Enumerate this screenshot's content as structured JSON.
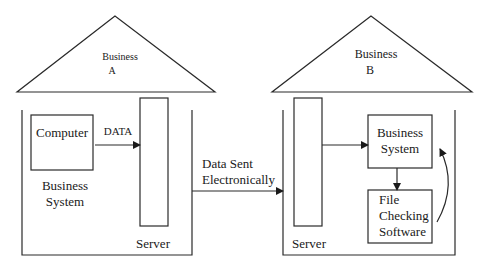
{
  "diagram": {
    "business_a": {
      "roof_label_line1": "Business",
      "roof_label_line2": "A",
      "computer_label": "Computer",
      "data_arrow_label": "DATA",
      "system_label_line1": "Business",
      "system_label_line2": "System",
      "server_label": "Server"
    },
    "connection": {
      "label_line1": "Data Sent",
      "label_line2": "Electronically"
    },
    "business_b": {
      "roof_label_line1": "Business",
      "roof_label_line2": "B",
      "server_label": "Server",
      "business_system_line1": "Business",
      "business_system_line2": "System",
      "file_checking_line1": "File",
      "file_checking_line2": "Checking",
      "file_checking_line3": "Software"
    },
    "colors": {
      "stroke": "#2a2a2a",
      "background": "#ffffff"
    }
  }
}
